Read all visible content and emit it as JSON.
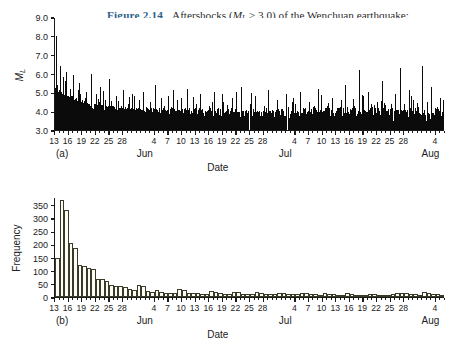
{
  "caption": {
    "figure_label": "Figure 2.14",
    "line1_a": "Aftershocks (",
    "line1_m": "M",
    "line1_sub": "L",
    "line1_b": " > 3.0) of the Wenchuan earthquake:",
    "line2_a": "(a) ",
    "line2_mt": "M–t",
    "line2_b": " plot; (b) daily frequency histogram (Jiang et al., 2009).",
    "accent_color": "#2c5f8a",
    "text_color": "#2b2b2b"
  },
  "panel_a": {
    "label": "(a)",
    "ylabel": "M",
    "ylabel_sub": "L",
    "xlabel": "Date"
  },
  "panel_b": {
    "label": "(b)",
    "ylabel": "Frequency",
    "xlabel": "Date"
  },
  "axis": {
    "day_ticks": [
      13,
      16,
      19,
      22,
      25,
      28,
      4,
      7,
      10,
      13,
      16,
      19,
      22,
      25,
      28,
      4,
      7,
      10,
      13,
      16,
      19,
      22,
      25,
      28,
      4
    ],
    "day_tick_positions": [
      0,
      3,
      6,
      9,
      12,
      15,
      22,
      25,
      28,
      31,
      34,
      37,
      40,
      43,
      46,
      53,
      56,
      59,
      62,
      65,
      68,
      71,
      74,
      77,
      84
    ],
    "months": [
      {
        "name": "Jun",
        "pos": 20
      },
      {
        "name": "Jul",
        "pos": 51
      },
      {
        "name": "Aug",
        "pos": 83
      }
    ],
    "x_min": 0,
    "x_max": 86
  },
  "chart_data": [
    {
      "type": "line",
      "title": "(a) M–t plot",
      "xlabel": "Date",
      "ylabel": "ML",
      "ylim": [
        3.0,
        9.0
      ],
      "yticks": [
        "3.0",
        "4.0",
        "5.0",
        "6.0",
        "7.0",
        "8.0",
        "9.0"
      ],
      "xlim": [
        0,
        86
      ],
      "grid": false,
      "note": "Stick plot of aftershock magnitudes ML>3.0 versus time, 13 May - 5 Aug 2008. Mainshock-day spike reaches ML 8.0.",
      "sticks": [
        [
          0.2,
          8.0
        ],
        [
          0.4,
          5.4
        ],
        [
          0.6,
          4.6
        ],
        [
          0.8,
          5.1
        ],
        [
          1.0,
          6.4
        ],
        [
          1.2,
          4.3
        ],
        [
          1.4,
          5.0
        ],
        [
          1.6,
          4.1
        ],
        [
          1.8,
          5.8
        ],
        [
          2.0,
          4.4
        ],
        [
          2.2,
          4.0
        ],
        [
          2.4,
          6.1
        ],
        [
          2.6,
          4.2
        ],
        [
          2.8,
          4.8
        ],
        [
          3.0,
          4.0
        ],
        [
          3.2,
          5.2
        ],
        [
          3.4,
          4.1
        ],
        [
          3.6,
          4.5
        ],
        [
          3.8,
          4.0
        ],
        [
          4.0,
          5.9
        ],
        [
          4.2,
          4.2
        ],
        [
          4.4,
          4.0
        ],
        [
          4.6,
          4.7
        ],
        [
          4.8,
          4.0
        ],
        [
          5.0,
          4.3
        ],
        [
          5.2,
          4.0
        ],
        [
          5.4,
          5.5
        ],
        [
          5.6,
          4.1
        ],
        [
          5.8,
          4.0
        ],
        [
          6.0,
          4.6
        ],
        [
          6.2,
          4.0
        ],
        [
          6.4,
          4.2
        ],
        [
          6.6,
          4.0
        ],
        [
          6.8,
          5.0
        ],
        [
          7.0,
          4.1
        ],
        [
          7.2,
          4.0
        ],
        [
          7.4,
          4.4
        ],
        [
          7.6,
          4.0
        ],
        [
          7.8,
          4.2
        ],
        [
          8.0,
          6.0
        ],
        [
          8.2,
          4.1
        ],
        [
          8.4,
          4.0
        ],
        [
          8.6,
          4.3
        ],
        [
          8.8,
          4.0
        ],
        [
          9.0,
          4.9
        ],
        [
          9.2,
          4.0
        ],
        [
          9.4,
          4.1
        ],
        [
          9.6,
          4.5
        ],
        [
          9.8,
          4.0
        ],
        [
          10.0,
          5.3
        ],
        [
          10.5,
          4.1
        ],
        [
          11.0,
          4.6
        ],
        [
          11.5,
          4.0
        ],
        [
          12.0,
          5.7
        ],
        [
          12.5,
          4.2
        ],
        [
          13.0,
          4.0
        ],
        [
          13.5,
          4.8
        ],
        [
          14.0,
          4.0
        ],
        [
          14.5,
          4.3
        ],
        [
          15.0,
          5.1
        ],
        [
          15.5,
          4.0
        ],
        [
          16.0,
          4.4
        ],
        [
          16.5,
          4.0
        ],
        [
          17.0,
          4.9
        ],
        [
          17.5,
          4.1
        ],
        [
          18.0,
          4.0
        ],
        [
          18.5,
          4.6
        ],
        [
          19.0,
          4.0
        ],
        [
          19.5,
          5.0
        ],
        [
          20.0,
          4.2
        ],
        [
          21.0,
          4.5
        ],
        [
          22.0,
          5.4
        ],
        [
          23.0,
          4.0
        ],
        [
          24.0,
          4.3
        ],
        [
          25.0,
          4.8
        ],
        [
          26.0,
          4.0
        ],
        [
          27.0,
          4.6
        ],
        [
          28.0,
          4.1
        ],
        [
          29.0,
          5.2
        ],
        [
          30.0,
          4.0
        ],
        [
          31.0,
          4.4
        ],
        [
          32.0,
          4.9
        ],
        [
          33.0,
          4.0
        ],
        [
          34.0,
          4.3
        ],
        [
          35.0,
          5.0
        ],
        [
          36.0,
          4.1
        ],
        [
          37.0,
          4.5
        ],
        [
          38.0,
          4.0
        ],
        [
          39.0,
          4.7
        ],
        [
          40.0,
          4.2
        ],
        [
          41.0,
          5.3
        ],
        [
          42.0,
          4.0
        ],
        [
          43.0,
          4.4
        ],
        [
          44.0,
          4.8
        ],
        [
          45.0,
          4.0
        ],
        [
          46.0,
          4.3
        ],
        [
          47.0,
          5.1
        ],
        [
          48.0,
          4.0
        ],
        [
          49.0,
          4.6
        ],
        [
          50.0,
          4.1
        ],
        [
          51.0,
          4.9
        ],
        [
          52.0,
          4.0
        ],
        [
          53.0,
          4.4
        ],
        [
          54.0,
          5.0
        ],
        [
          55.0,
          4.0
        ],
        [
          56.0,
          4.5
        ],
        [
          57.0,
          4.2
        ],
        [
          58.0,
          5.2
        ],
        [
          59.0,
          4.0
        ],
        [
          60.0,
          4.3
        ],
        [
          61.0,
          4.7
        ],
        [
          62.0,
          4.0
        ],
        [
          63.0,
          4.6
        ],
        [
          64.0,
          5.4
        ],
        [
          65.0,
          4.1
        ],
        [
          66.0,
          4.3
        ],
        [
          67.0,
          6.2
        ],
        [
          68.0,
          4.8
        ],
        [
          69.0,
          5.0
        ],
        [
          70.0,
          4.2
        ],
        [
          71.0,
          4.5
        ],
        [
          72.0,
          5.6
        ],
        [
          73.0,
          4.0
        ],
        [
          74.0,
          4.4
        ],
        [
          75.0,
          4.9
        ],
        [
          76.0,
          6.3
        ],
        [
          77.0,
          4.3
        ],
        [
          78.0,
          5.1
        ],
        [
          79.0,
          4.6
        ],
        [
          80.0,
          4.2
        ],
        [
          81.0,
          6.4
        ],
        [
          82.0,
          4.5
        ],
        [
          83.0,
          5.3
        ],
        [
          84.0,
          4.1
        ],
        [
          85.0,
          4.7
        ]
      ]
    },
    {
      "type": "bar",
      "title": "(b) daily frequency histogram",
      "xlabel": "Date",
      "ylabel": "Frequency",
      "ylim": [
        0,
        380
      ],
      "yticks": [
        0,
        50,
        100,
        150,
        200,
        250,
        300,
        350
      ],
      "xlim": [
        0,
        86
      ],
      "grid": false,
      "note": "Daily counts of ML>3.0 aftershocks, decaying per Omori's law from ~370 on 13 May.",
      "values": [
        150,
        370,
        330,
        205,
        185,
        120,
        118,
        112,
        108,
        70,
        68,
        62,
        45,
        42,
        40,
        38,
        30,
        28,
        45,
        42,
        22,
        20,
        26,
        18,
        16,
        15,
        14,
        30,
        27,
        16,
        15,
        14,
        13,
        12,
        22,
        20,
        14,
        13,
        12,
        20,
        18,
        13,
        12,
        11,
        18,
        16,
        12,
        11,
        10,
        17,
        15,
        11,
        10,
        10,
        16,
        14,
        10,
        10,
        9,
        15,
        13,
        10,
        9,
        9,
        14,
        12,
        9,
        9,
        8,
        13,
        12,
        9,
        8,
        8,
        13,
        14,
        16,
        14,
        12,
        10,
        9,
        18,
        16,
        12,
        10,
        9
      ]
    }
  ]
}
